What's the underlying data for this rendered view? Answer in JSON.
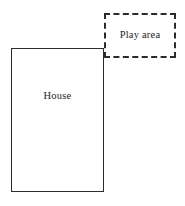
{
  "diagram": {
    "background_color": "#ffffff",
    "line_color": "#2b2b2b",
    "canvas": {
      "width": 185,
      "height": 206
    },
    "shapes": [
      {
        "id": "house",
        "label": "House",
        "outline_style": "solid",
        "x": 11,
        "y": 48,
        "width": 93,
        "height": 144
      },
      {
        "id": "play-area",
        "label": "Play area",
        "outline_style": "dashed",
        "x": 104,
        "y": 13,
        "width": 72,
        "height": 45
      }
    ]
  }
}
